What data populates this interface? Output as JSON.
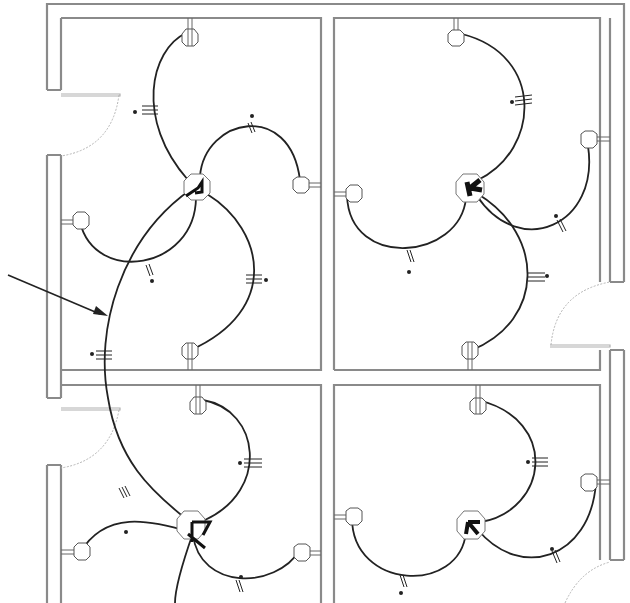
{
  "diagram": {
    "title": "Electrical lighting circuit plan — four rooms",
    "colors": {
      "wall": "#8a8a8a",
      "wire": "#222222",
      "fixture": "#555555",
      "door": "#b5b5b5",
      "background": "#ffffff"
    },
    "rooms": [
      {
        "id": "room-top-left",
        "x": 61,
        "y": 18,
        "w": 260,
        "h": 352
      },
      {
        "id": "room-top-right",
        "x": 334,
        "y": 18,
        "w": 266,
        "h": 352
      },
      {
        "id": "room-bottom-left",
        "x": 61,
        "y": 385,
        "w": 260,
        "h": 218
      },
      {
        "id": "room-bottom-right",
        "x": 334,
        "y": 385,
        "w": 266,
        "h": 218
      }
    ],
    "hubs": [
      {
        "id": "hub-top-left",
        "x": 197,
        "y": 186,
        "symbol": "junction-box"
      },
      {
        "id": "hub-top-right",
        "x": 470,
        "y": 188,
        "symbol": "junction-box"
      },
      {
        "id": "hub-bottom-left",
        "x": 192,
        "y": 525,
        "symbol": "junction-box"
      },
      {
        "id": "hub-bottom-right",
        "x": 471,
        "y": 525,
        "symbol": "junction-box"
      }
    ],
    "fixtures_count": 16,
    "annotation": {
      "type": "arrow",
      "points_to": "home-run wire",
      "label": ""
    },
    "legend": []
  }
}
